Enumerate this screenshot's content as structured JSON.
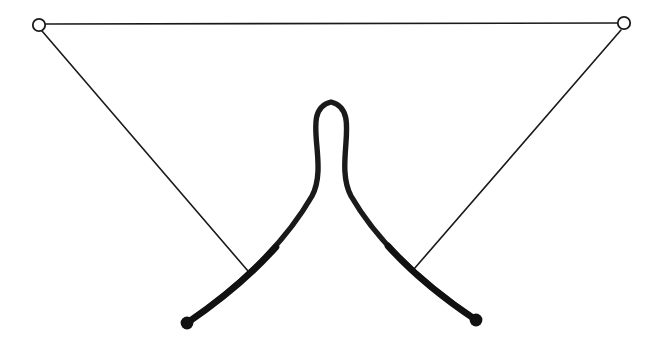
{
  "figure": {
    "background_color": "#ffffff",
    "stroke_color": "#1a1a1a",
    "width": 657,
    "height": 346
  },
  "nodes": {
    "open_markers": [
      {
        "name": "top-left-open-node",
        "cx": 39,
        "cy": 25,
        "r": 6.2,
        "fill": "#ffffff",
        "stroke": "#1a1a1a",
        "stroke_width": 1.8
      },
      {
        "name": "top-right-open-node",
        "cx": 624,
        "cy": 23,
        "r": 6.2,
        "fill": "#ffffff",
        "stroke": "#1a1a1a",
        "stroke_width": 1.8
      }
    ],
    "filled_markers": [
      {
        "name": "bottom-left-filled-node",
        "cx": 187,
        "cy": 323,
        "r": 6.4,
        "fill": "#111111"
      },
      {
        "name": "bottom-right-filled-node",
        "cx": 476,
        "cy": 320,
        "r": 6.4,
        "fill": "#111111"
      }
    ]
  },
  "strands": {
    "top_chord": {
      "name": "top-chord-line",
      "d": "M 45 24 L 618 23",
      "stroke_width": 1.6
    },
    "left_diagonal": {
      "name": "left-diagonal-line",
      "d": "M 42 31 L 248 271",
      "stroke_width": 1.6
    },
    "right_diagonal": {
      "name": "right-diagonal-line",
      "d": "M 621 30 L 414 269",
      "stroke_width": 1.6
    },
    "loop_curve": {
      "name": "thick-loop-curve",
      "d": "M 187 323 C 232 292 282 248 312 196 C 330 162 299 110 331 102 C 363 110 333 162 351 196 C 381 248 432 290 476 320",
      "stroke_width": 5.4,
      "stroke_width_end": 7.0
    }
  },
  "chart_data": {
    "type": "line",
    "xlabel": "",
    "ylabel": "",
    "xlim": [
      0,
      657
    ],
    "ylim": [
      346,
      0
    ],
    "grid": false,
    "legend": null,
    "series": [
      {
        "name": "thick-loop-curve",
        "style": "thick-solid",
        "color": "#111111",
        "linewidth": 5.4,
        "points": [
          [
            187,
            323
          ],
          [
            205,
            311
          ],
          [
            223,
            298
          ],
          [
            241,
            283
          ],
          [
            258,
            267
          ],
          [
            274,
            249
          ],
          [
            288,
            231
          ],
          [
            300,
            212
          ],
          [
            309,
            197
          ],
          [
            315,
            183
          ],
          [
            314,
            168
          ],
          [
            308,
            152
          ],
          [
            302,
            137
          ],
          [
            300,
            123
          ],
          [
            305,
            112
          ],
          [
            316,
            104
          ],
          [
            331,
            101
          ],
          [
            346,
            104
          ],
          [
            357,
            112
          ],
          [
            362,
            123
          ],
          [
            361,
            137
          ],
          [
            355,
            152
          ],
          [
            349,
            168
          ],
          [
            348,
            183
          ],
          [
            354,
            197
          ],
          [
            363,
            212
          ],
          [
            375,
            231
          ],
          [
            389,
            249
          ],
          [
            405,
            267
          ],
          [
            422,
            283
          ],
          [
            440,
            297
          ],
          [
            458,
            310
          ],
          [
            476,
            320
          ]
        ]
      },
      {
        "name": "top-chord-line",
        "style": "thin-solid",
        "color": "#1a1a1a",
        "linewidth": 1.6,
        "points": [
          [
            45,
            24
          ],
          [
            618,
            23
          ]
        ]
      },
      {
        "name": "left-diagonal-line",
        "style": "thin-solid",
        "color": "#1a1a1a",
        "linewidth": 1.6,
        "points": [
          [
            42,
            31
          ],
          [
            248,
            271
          ]
        ]
      },
      {
        "name": "right-diagonal-line",
        "style": "thin-solid",
        "color": "#1a1a1a",
        "linewidth": 1.6,
        "points": [
          [
            621,
            30
          ],
          [
            414,
            269
          ]
        ]
      }
    ],
    "markers": [
      {
        "name": "top-left-open-node",
        "x": 39,
        "y": 25,
        "style": "open-circle"
      },
      {
        "name": "top-right-open-node",
        "x": 624,
        "y": 23,
        "style": "open-circle"
      },
      {
        "name": "bottom-left-filled-node",
        "x": 187,
        "y": 323,
        "style": "filled-circle"
      },
      {
        "name": "bottom-right-filled-node",
        "x": 476,
        "y": 320,
        "style": "filled-circle"
      }
    ],
    "annotations": [
      {
        "name": "loop-apex",
        "x": 331,
        "y": 101,
        "text": ""
      },
      {
        "name": "loop-self-crossing",
        "x": 332,
        "y": 197,
        "text": ""
      },
      {
        "name": "diagonals-crossing",
        "x": 331,
        "y": 228,
        "text": ""
      }
    ]
  }
}
